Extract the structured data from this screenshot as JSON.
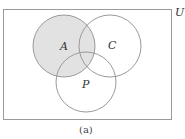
{
  "diagram": {
    "type": "venn",
    "universe_label": "U",
    "caption": "(a)",
    "colors": {
      "stroke": "#9a9a9a",
      "shade": "#e2e2e2",
      "background": "#ffffff",
      "text": "#333333"
    },
    "universe_rect": {
      "x": 3.5,
      "y": 9.5,
      "width": 168,
      "height": 110
    },
    "sets": [
      {
        "name": "A",
        "label": "A",
        "cx": 64,
        "cy": 46,
        "r": 31,
        "shaded": true
      },
      {
        "name": "C",
        "label": "C",
        "cx": 110,
        "cy": 46,
        "r": 31,
        "shaded": false
      },
      {
        "name": "P",
        "label": "P",
        "cx": 86,
        "cy": 82,
        "r": 30,
        "shaded": false
      }
    ],
    "shaded_region": "A"
  }
}
